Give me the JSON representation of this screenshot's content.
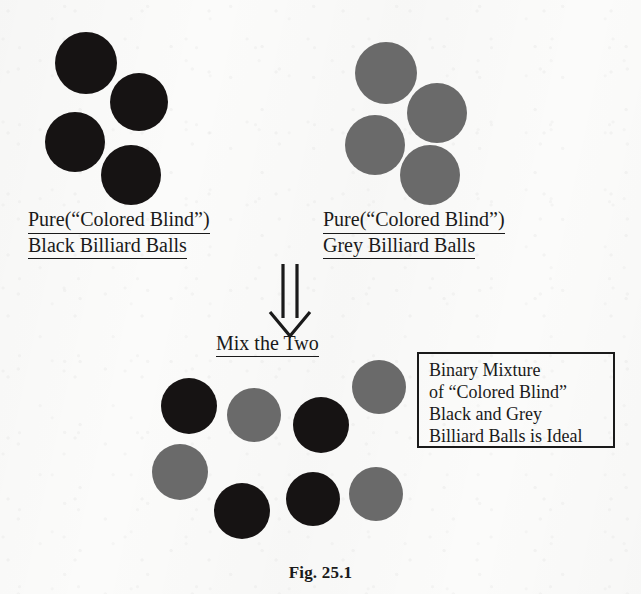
{
  "figure": {
    "caption": "Fig. 25.1",
    "background_color": "#fbfbfa",
    "black_ball_color": "#161313",
    "grey_ball_color": "#6a6a6a",
    "ink_color": "#1a1a1a"
  },
  "left_group": {
    "label_line1": "Pure(“Colored Blind”)",
    "label_line2": "Black Billiard Balls",
    "ball_color_name": "black",
    "ball_count": 4,
    "balls": [
      {
        "x": 55,
        "y": 32,
        "d": 62,
        "color": "black"
      },
      {
        "x": 110,
        "y": 73,
        "d": 58,
        "color": "black"
      },
      {
        "x": 45,
        "y": 112,
        "d": 60,
        "color": "black"
      },
      {
        "x": 101,
        "y": 145,
        "d": 60,
        "color": "black"
      }
    ]
  },
  "right_group": {
    "label_line1": "Pure(“Colored Blind”)",
    "label_line2": "Grey Billiard Balls",
    "ball_color_name": "grey",
    "ball_count": 4,
    "balls": [
      {
        "x": 355,
        "y": 42,
        "d": 62,
        "color": "grey"
      },
      {
        "x": 407,
        "y": 83,
        "d": 60,
        "color": "grey"
      },
      {
        "x": 345,
        "y": 115,
        "d": 60,
        "color": "grey"
      },
      {
        "x": 400,
        "y": 145,
        "d": 60,
        "color": "grey"
      }
    ]
  },
  "arrow": {
    "icon_name": "double-line-down-arrow-icon",
    "x": 262,
    "y": 262,
    "width": 56,
    "height": 76
  },
  "mix_label": {
    "text": "Mix the Two",
    "x": 216,
    "y": 332
  },
  "mixture_group": {
    "ball_count": 8,
    "black_count": 4,
    "grey_count": 4,
    "balls": [
      {
        "x": 161,
        "y": 378,
        "d": 56,
        "color": "black"
      },
      {
        "x": 227,
        "y": 388,
        "d": 54,
        "color": "grey"
      },
      {
        "x": 293,
        "y": 397,
        "d": 56,
        "color": "black"
      },
      {
        "x": 352,
        "y": 360,
        "d": 54,
        "color": "grey"
      },
      {
        "x": 152,
        "y": 444,
        "d": 56,
        "color": "grey"
      },
      {
        "x": 214,
        "y": 483,
        "d": 56,
        "color": "black"
      },
      {
        "x": 286,
        "y": 472,
        "d": 54,
        "color": "black"
      },
      {
        "x": 349,
        "y": 467,
        "d": 54,
        "color": "grey"
      }
    ]
  },
  "note_box": {
    "x": 417,
    "y": 352,
    "width": 198,
    "height": 96,
    "lines": [
      "Binary Mixture",
      "of “Colored Blind”",
      "Black and Grey",
      "Billiard Balls is Ideal"
    ]
  }
}
